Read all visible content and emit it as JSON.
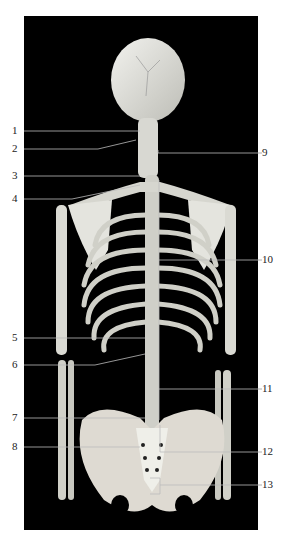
{
  "figure": {
    "background_color": "#000000",
    "page_color": "#ffffff",
    "labels_left": [
      {
        "id": "1",
        "y": 131
      },
      {
        "id": "2",
        "y": 149
      },
      {
        "id": "3",
        "y": 176
      },
      {
        "id": "4",
        "y": 199
      },
      {
        "id": "5",
        "y": 338
      },
      {
        "id": "6",
        "y": 365
      },
      {
        "id": "7",
        "y": 418
      },
      {
        "id": "8",
        "y": 447
      }
    ],
    "labels_right": [
      {
        "id": "9",
        "y": 153
      },
      {
        "id": "10",
        "y": 260
      },
      {
        "id": "11",
        "y": 389
      },
      {
        "id": "12",
        "y": 452
      },
      {
        "id": "13",
        "y": 485
      }
    ]
  }
}
